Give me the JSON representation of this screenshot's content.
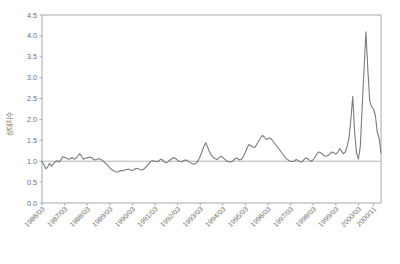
{
  "chart_data": {
    "type": "line",
    "title": "",
    "xlabel": "",
    "ylabel": "상대지수",
    "ylim": [
      0.0,
      4.5
    ],
    "yticks": [
      "0.0",
      "0.5",
      "1.0",
      "1.5",
      "2.0",
      "2.5",
      "3.0",
      "3.5",
      "4.0",
      "4.5"
    ],
    "ytick_values": [
      0.0,
      0.5,
      1.0,
      1.5,
      2.0,
      2.5,
      3.0,
      3.5,
      4.0,
      4.5
    ],
    "grid": false,
    "legend": "none",
    "reference_line": 1.0,
    "line_color": "#7b7b7b",
    "axis_color": "#a8a8a8",
    "xtick_labels": [
      "1986/03",
      "1987/03",
      "1988/03",
      "1989/03",
      "1990/03",
      "1991/03",
      "1992/03",
      "1993/03",
      "1994/03",
      "1995/03",
      "1996/03",
      "1997/03",
      "1998/03",
      "1999/03",
      "2000/03",
      "2000/11"
    ],
    "xtick_positions": [
      0,
      12,
      24,
      36,
      48,
      60,
      72,
      84,
      96,
      108,
      120,
      132,
      144,
      156,
      168,
      176
    ],
    "x_start_label": "1986/03",
    "x_end_label": "2000/11",
    "n_points": 177,
    "values": [
      0.99,
      0.92,
      0.82,
      0.86,
      0.95,
      0.88,
      0.93,
      0.99,
      1.01,
      0.98,
      1.03,
      1.11,
      1.09,
      1.07,
      1.05,
      1.06,
      1.09,
      1.05,
      1.07,
      1.12,
      1.18,
      1.12,
      1.05,
      1.07,
      1.08,
      1.09,
      1.1,
      1.06,
      1.03,
      1.04,
      1.06,
      1.05,
      1.02,
      0.98,
      0.94,
      0.89,
      0.84,
      0.8,
      0.77,
      0.75,
      0.74,
      0.76,
      0.78,
      0.77,
      0.79,
      0.8,
      0.81,
      0.79,
      0.78,
      0.8,
      0.83,
      0.82,
      0.8,
      0.79,
      0.81,
      0.85,
      0.9,
      0.96,
      1.0,
      1.01,
      1.0,
      0.99,
      1.01,
      1.05,
      1.03,
      0.98,
      0.96,
      0.99,
      1.03,
      1.06,
      1.09,
      1.06,
      1.02,
      1.0,
      0.99,
      1.01,
      1.03,
      1.02,
      0.99,
      0.96,
      0.94,
      0.93,
      0.96,
      1.02,
      1.12,
      1.24,
      1.36,
      1.44,
      1.33,
      1.22,
      1.14,
      1.09,
      1.06,
      1.04,
      1.08,
      1.12,
      1.09,
      1.05,
      1.01,
      0.99,
      0.98,
      1.0,
      1.04,
      1.08,
      1.06,
      1.03,
      1.05,
      1.12,
      1.22,
      1.33,
      1.4,
      1.37,
      1.34,
      1.33,
      1.4,
      1.48,
      1.55,
      1.62,
      1.58,
      1.52,
      1.54,
      1.56,
      1.52,
      1.46,
      1.4,
      1.34,
      1.28,
      1.22,
      1.16,
      1.1,
      1.05,
      1.02,
      1.0,
      0.99,
      1.01,
      1.04,
      1.02,
      0.99,
      0.98,
      1.03,
      1.08,
      1.06,
      1.02,
      1.0,
      1.04,
      1.1,
      1.18,
      1.22,
      1.2,
      1.16,
      1.13,
      1.12,
      1.14,
      1.18,
      1.22,
      1.2,
      1.17,
      1.21,
      1.3,
      1.24,
      1.18,
      1.22,
      1.35,
      1.55,
      2.0,
      2.55,
      1.7,
      1.2,
      1.05,
      1.35,
      2.3,
      3.2,
      4.1,
      3.2,
      2.45,
      2.3,
      2.25,
      2.1,
      1.7,
      1.55,
      1.2
    ]
  }
}
